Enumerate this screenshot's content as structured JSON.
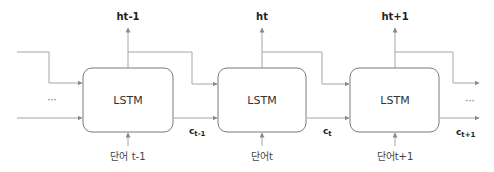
{
  "diagram": {
    "type": "LSTM unrolled sequence",
    "colors": {
      "line": "#9a9a9a",
      "box_border": "#7a7a7a",
      "text": "#333333"
    },
    "ellipsis_left": "···",
    "ellipsis_right": "···",
    "cells": [
      {
        "label": "LSTM",
        "hidden_output": "ht-1",
        "input": "단어 t-1",
        "cell_state_base": "c",
        "cell_state_sub": "t-1"
      },
      {
        "label": "LSTM",
        "hidden_output": "ht",
        "input": "단어t",
        "cell_state_base": "c",
        "cell_state_sub": "t"
      },
      {
        "label": "LSTM",
        "hidden_output": "ht+1",
        "input": "단어t+1",
        "cell_state_base": "c",
        "cell_state_sub": "t+1"
      }
    ]
  }
}
